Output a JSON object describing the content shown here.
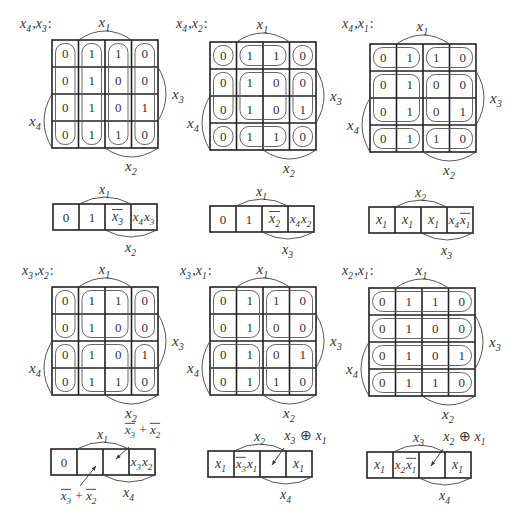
{
  "figure": {
    "kmap_values": [
      [
        "0",
        "1",
        "1",
        "0"
      ],
      [
        "0",
        "1",
        "0",
        "0"
      ],
      [
        "0",
        "1",
        "0",
        "1"
      ],
      [
        "0",
        "1",
        "1",
        "0"
      ]
    ],
    "axis_labels": {
      "top": "x1",
      "right": "x3",
      "left": "x4",
      "bottom": "x2"
    },
    "panels": [
      {
        "title": "x4,x3:",
        "grouping": "columns",
        "strip": {
          "cells": [
            "0",
            "1",
            "x̄3",
            "x4x3"
          ],
          "top_arc_label": "x1",
          "bottom_arc_label": "x2"
        }
      },
      {
        "title": "x4,x2:",
        "grouping": "blocks-2x2-split-rows",
        "strip": {
          "cells": [
            "0",
            "1",
            "x̄2",
            "x4x2"
          ],
          "top_arc_label": "x1",
          "bottom_arc_label": "x3"
        }
      },
      {
        "title": "x4,x1:",
        "grouping": "blocks-2-cols",
        "strip": {
          "cells": [
            "x1",
            "x1",
            "x1",
            "x4x̄1"
          ],
          "top_arc_label": "x2",
          "bottom_arc_label": "x3"
        }
      },
      {
        "title": "x3,x2:",
        "grouping": "blocks-2-rows-cols",
        "strip": {
          "cells": [
            "0",
            "",
            "",
            "x3x2"
          ],
          "top_arc_label": "x1",
          "bottom_arc_label": "x4",
          "annotations": [
            "x̄3 + x̄2",
            "x̄3 + x̄2"
          ]
        }
      },
      {
        "title": "x3,x1:",
        "grouping": "blocks-2x2",
        "strip": {
          "cells": [
            "x1",
            "x̄3x1",
            "",
            "x1"
          ],
          "top_arc_label": "x2",
          "bottom_arc_label": "x4",
          "annotations": [
            "x3 ⊕ x1"
          ]
        }
      },
      {
        "title": "x2,x1:",
        "grouping": "rows",
        "strip": {
          "cells": [
            "x1",
            "x2x̄1",
            "",
            "x1"
          ],
          "top_arc_label": "x3",
          "bottom_arc_label": "x4",
          "annotations": [
            "x2 ⊕ x1"
          ]
        }
      }
    ]
  }
}
